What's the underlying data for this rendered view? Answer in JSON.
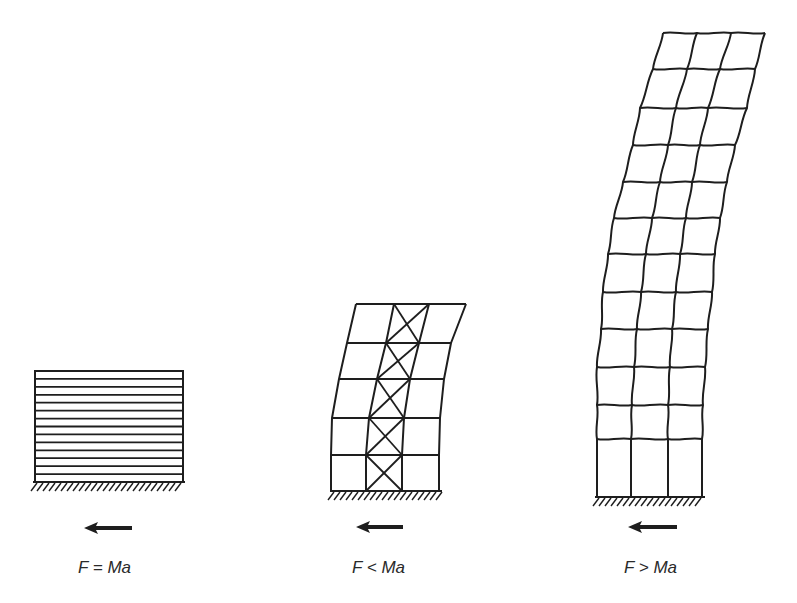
{
  "diagram": {
    "stroke_color": "#1e1e1e",
    "background": "#ffffff",
    "structures": [
      {
        "id": "rigid-block",
        "label": "F = Ma",
        "type": "rigid-layered-block",
        "layer_lines": 15,
        "box": {
          "left": 35,
          "right": 183,
          "top": 371,
          "bottom": 482
        },
        "ground": {
          "x1": 33,
          "x2": 185,
          "y": 482
        },
        "arrow": {
          "x_tail": 132,
          "x_head": 84,
          "y": 528
        },
        "label_pos": {
          "x": 78,
          "y": 558
        }
      },
      {
        "id": "braced-frame",
        "label": "F < Ma",
        "type": "braced-frame",
        "stories": 5,
        "bays": 3,
        "braced_bay": 1,
        "floors_y": [
          491,
          455,
          418,
          379,
          343,
          304
        ],
        "columns_x": [
          [
            331,
            331,
            332,
            339,
            347,
            356
          ],
          [
            366,
            366,
            369,
            377,
            386,
            394
          ],
          [
            402,
            402,
            404,
            410,
            419,
            429
          ],
          [
            439,
            439,
            440,
            444,
            451,
            466
          ]
        ],
        "ground": {
          "x1": 330,
          "x2": 442,
          "y": 491
        },
        "arrow": {
          "x_tail": 403,
          "x_head": 356,
          "y": 527
        },
        "label_pos": {
          "x": 352,
          "y": 558
        }
      },
      {
        "id": "flexible-frame",
        "label": "F > Ma",
        "type": "wavy-moment-frame",
        "stories": 12,
        "bays": 3,
        "floors_y": [
          497,
          439,
          405,
          367,
          329,
          292,
          254,
          218,
          182,
          145,
          108,
          69,
          33
        ],
        "columns_x": [
          [
            597,
            597,
            597,
            597,
            601,
            603,
            608,
            614,
            623,
            633,
            640,
            653,
            663
          ],
          [
            631,
            631,
            632,
            634,
            637,
            641,
            646,
            652,
            660,
            668,
            676,
            687,
            697
          ],
          [
            668,
            668,
            668,
            670,
            672,
            676,
            680,
            686,
            692,
            700,
            708,
            720,
            731
          ],
          [
            702,
            702,
            703,
            705,
            708,
            712,
            715,
            720,
            727,
            735,
            747,
            755,
            765
          ]
        ],
        "ground": {
          "x1": 595,
          "x2": 705,
          "y": 497
        },
        "arrow": {
          "x_tail": 677,
          "x_head": 628,
          "y": 527
        },
        "label_pos": {
          "x": 624,
          "y": 558
        }
      }
    ]
  }
}
